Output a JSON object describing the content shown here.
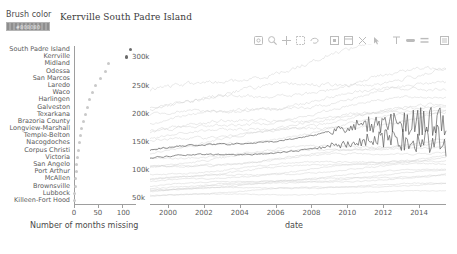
{
  "widgets": {
    "brush_color": {
      "label": "Brush color",
      "swatch_value": "#808080",
      "swatch_text": "#808080"
    }
  },
  "title": {
    "selected_cities": [
      "Kerrville",
      "South Padre Island"
    ],
    "text": "Kerrville  South Padre Island"
  },
  "toolbar": {
    "tools": [
      {
        "name": "pan-icon",
        "label": "Pan"
      },
      {
        "name": "box-zoom-icon",
        "label": "Box Zoom"
      },
      {
        "name": "crosshair-icon",
        "label": "Crosshair"
      },
      {
        "name": "box-select-icon",
        "label": "Box Select"
      },
      {
        "name": "lasso-select-icon",
        "label": "Lasso Select"
      },
      {
        "name": "tap-select-icon",
        "label": "Tap"
      },
      {
        "name": "save-icon",
        "label": "Save"
      },
      {
        "name": "reset-icon",
        "label": "Reset"
      },
      {
        "name": "hover-icon",
        "label": "Hover"
      },
      {
        "name": "wheel-zoom-icon",
        "label": "Wheel Zoom"
      },
      {
        "name": "zoom-in-icon",
        "label": "Zoom In"
      },
      {
        "name": "zoom-out-icon",
        "label": "Zoom Out"
      },
      {
        "name": "help-icon",
        "label": "Help"
      }
    ]
  },
  "chart_data": [
    {
      "type": "scatter",
      "id": "months-missing-dotplot",
      "title": "",
      "xlabel": "Number of months missing",
      "ylabel": "",
      "xlim": [
        0,
        130
      ],
      "xticks": [
        0,
        50,
        100
      ],
      "xticklabels": [
        "0",
        "50",
        "100"
      ],
      "grid": false,
      "categories": [
        "South Padre Island",
        "Kerrville",
        "Midland",
        "Odessa",
        "San Marcos",
        "Laredo",
        "Waco",
        "Harlingen",
        "Galveston",
        "Texarkana",
        "Brazoria County",
        "Longview-Marshall",
        "Temple-Belton",
        "Nacogdoches",
        "Corpus Christi",
        "Victoria",
        "San Angelo",
        "Port Arthur",
        "McAllen",
        "Brownsville",
        "Lubbock",
        "Killeen-Fort Hood"
      ],
      "values": [
        118,
        110,
        72,
        66,
        55,
        45,
        38,
        33,
        28,
        24,
        19,
        16,
        13,
        11,
        9,
        7,
        6,
        5,
        4,
        3,
        2,
        1
      ],
      "highlighted": [
        "South Padre Island",
        "Kerrville"
      ],
      "highlight_color": "#6b6b6b",
      "point_color": "#c9c9c9"
    },
    {
      "type": "line",
      "id": "employment-timeseries",
      "title": "",
      "xlabel": "date",
      "ylabel": "",
      "xlim": [
        1999,
        2015.5
      ],
      "ylim": [
        40000,
        320000
      ],
      "xticks": [
        2000,
        2002,
        2004,
        2006,
        2008,
        2010,
        2012,
        2014
      ],
      "xticklabels": [
        "2000",
        "2002",
        "2004",
        "2006",
        "2008",
        "2010",
        "2012",
        "2014"
      ],
      "yticks": [
        50000,
        100000,
        150000,
        200000,
        250000,
        300000
      ],
      "yticklabels": [
        "50k",
        "100k",
        "150k",
        "200k",
        "250k",
        "300k"
      ],
      "grid": false,
      "legend": "none",
      "background_series_count": 26,
      "background_color": "#cfcfcf",
      "foreground_color": "#555555",
      "series": [
        {
          "name": "Kerrville",
          "highlighted": true
        },
        {
          "name": "South Padre Island",
          "highlighted": true
        }
      ]
    }
  ]
}
